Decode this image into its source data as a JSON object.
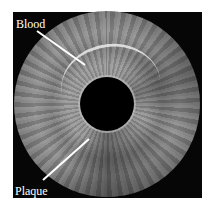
{
  "image": {
    "subject": "Intravascular ultrasound cross-section of an artery",
    "background_color": "#060606",
    "annotations": [
      {
        "label": "Blood",
        "arrow_from": [
          37,
          31
        ],
        "arrow_to": [
          85,
          65
        ]
      },
      {
        "label": "Plaque",
        "arrow_from": [
          43,
          180
        ],
        "arrow_to": [
          89,
          139
        ]
      }
    ],
    "arrow_color": "#ffffff",
    "label_color": "#ffffff"
  }
}
